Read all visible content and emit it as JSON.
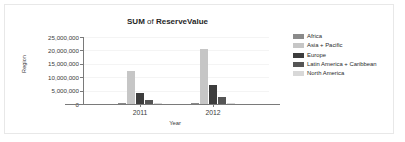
{
  "chart_data": {
    "type": "bar",
    "title": "SUM of ReserveValue",
    "title_bold_1": "SUM",
    "title_mid": " of ",
    "title_bold_2": "ReserveValue",
    "xlabel": "Year",
    "ylabel": "Region",
    "categories": [
      "2011",
      "2012"
    ],
    "ylim": [
      0,
      25000000
    ],
    "ytick_values": [
      25000000,
      20000000,
      15000000,
      10000000,
      5000000,
      0
    ],
    "ytick_labels": [
      "25,000,000",
      "20,000,000",
      "15,000,000",
      "10,000,000",
      "5,000,000",
      "0"
    ],
    "grid": true,
    "legend_position": "right",
    "series": [
      {
        "name": "Africa",
        "color": "#8a8a8a",
        "values": [
          180000,
          220000
        ]
      },
      {
        "name": "Asia + Pacific",
        "color": "#c6c6c6",
        "values": [
          12500000,
          20500000
        ]
      },
      {
        "name": "Europe",
        "color": "#3d3d3d",
        "values": [
          4000000,
          7200000
        ]
      },
      {
        "name": "Latin America + Caribbean",
        "color": "#555555",
        "values": [
          1500000,
          2700000
        ]
      },
      {
        "name": "North America",
        "color": "#d8d8d8",
        "values": [
          120000,
          140000
        ]
      }
    ]
  },
  "legend": {
    "entries": [
      {
        "label": "Africa",
        "color": "#8a8a8a"
      },
      {
        "label": "Asia + Pacific",
        "color": "#c6c6c6"
      },
      {
        "label": "Europe",
        "color": "#3d3d3d"
      },
      {
        "label": "Latin America + Caribbean",
        "color": "#555555"
      },
      {
        "label": "North America",
        "color": "#d8d8d8"
      }
    ]
  }
}
